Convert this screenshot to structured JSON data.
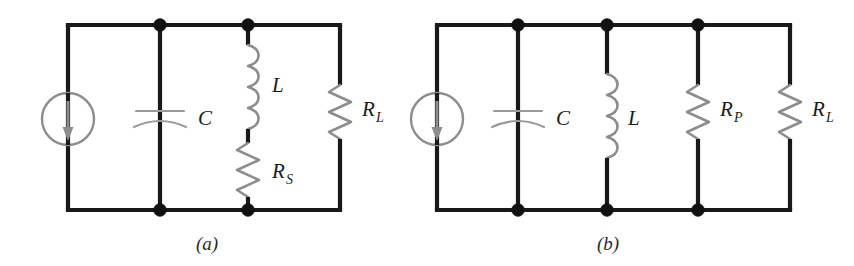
{
  "figure": {
    "background_color": "#ffffff",
    "wire_color": "#191919",
    "component_color": "#8d8d8d",
    "label_color": "#1b1b1b"
  },
  "circuits": [
    {
      "id": "a",
      "caption": "(a)",
      "description": "Current source driving C in parallel with a series L-Rs branch and load resistor RL",
      "components": [
        {
          "id": "a-source",
          "type": "current-source",
          "label": "",
          "arrow_direction": "down"
        },
        {
          "id": "a-cap",
          "type": "capacitor",
          "label": "C"
        },
        {
          "id": "a-ind",
          "type": "inductor",
          "label": "L"
        },
        {
          "id": "a-rs",
          "type": "resistor",
          "label": "R",
          "subscript": "S"
        },
        {
          "id": "a-rl",
          "type": "resistor",
          "label": "R",
          "subscript": "L"
        }
      ],
      "node_dots": 4
    },
    {
      "id": "b",
      "caption": "(b)",
      "description": "Current source driving C, L, RP and RL all in parallel",
      "components": [
        {
          "id": "b-source",
          "type": "current-source",
          "label": "",
          "arrow_direction": "down"
        },
        {
          "id": "b-cap",
          "type": "capacitor",
          "label": "C"
        },
        {
          "id": "b-ind",
          "type": "inductor",
          "label": "L"
        },
        {
          "id": "b-rp",
          "type": "resistor",
          "label": "R",
          "subscript": "P"
        },
        {
          "id": "b-rl",
          "type": "resistor",
          "label": "R",
          "subscript": "L"
        }
      ],
      "node_dots": 6
    }
  ],
  "labels": {
    "a_capacitor": "C",
    "a_inductor": "L",
    "a_rs_main": "R",
    "a_rs_sub": "S",
    "a_rl_main": "R",
    "a_rl_sub": "L",
    "b_capacitor": "C",
    "b_inductor": "L",
    "b_rp_main": "R",
    "b_rp_sub": "P",
    "b_rl_main": "R",
    "b_rl_sub": "L",
    "caption_a": "(a)",
    "caption_b": "(b)"
  }
}
